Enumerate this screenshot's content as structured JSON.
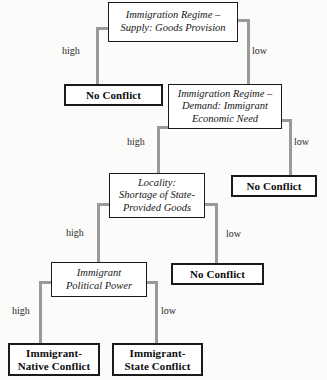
{
  "diagram": {
    "type": "decision-tree",
    "colors": {
      "background": "#fbfbfa",
      "node_border": "#1a1a1a",
      "node_fill": "#ffffff",
      "connector": "#9a9a9a",
      "text": "#161616"
    },
    "nodes": [
      {
        "id": "immigration-regime-supply",
        "kind": "decision",
        "lines": [
          "Immigration Regime –",
          "Supply: Goods Provision"
        ]
      },
      {
        "id": "no-conflict-1",
        "kind": "terminal",
        "lines": [
          "No Conflict"
        ]
      },
      {
        "id": "immigration-regime-demand",
        "kind": "decision",
        "lines": [
          "Immigration Regime –",
          "Demand: Immigrant",
          "Economic Need"
        ]
      },
      {
        "id": "no-conflict-2",
        "kind": "terminal",
        "lines": [
          "No Conflict"
        ]
      },
      {
        "id": "locality-shortage",
        "kind": "decision",
        "lines": [
          "Locality:",
          "Shortage of State-",
          "Provided Goods"
        ]
      },
      {
        "id": "no-conflict-3",
        "kind": "terminal",
        "lines": [
          "No Conflict"
        ]
      },
      {
        "id": "immigrant-political-power",
        "kind": "decision",
        "lines": [
          "Immigrant",
          "Political Power"
        ]
      },
      {
        "id": "immigrant-native-conflict",
        "kind": "terminal",
        "lines": [
          "Immigrant-",
          "Native Conflict"
        ]
      },
      {
        "id": "immigrant-state-conflict",
        "kind": "terminal",
        "lines": [
          "Immigrant-",
          "State Conflict"
        ]
      }
    ],
    "edges": [
      {
        "id": "supply-high",
        "from": "immigration-regime-supply",
        "to": "no-conflict-1",
        "label": "high"
      },
      {
        "id": "supply-low",
        "from": "immigration-regime-supply",
        "to": "immigration-regime-demand",
        "label": "low"
      },
      {
        "id": "demand-high",
        "from": "immigration-regime-demand",
        "to": "locality-shortage",
        "label": "high"
      },
      {
        "id": "demand-low",
        "from": "immigration-regime-demand",
        "to": "no-conflict-2",
        "label": "low"
      },
      {
        "id": "locality-high",
        "from": "locality-shortage",
        "to": "immigrant-political-power",
        "label": "high"
      },
      {
        "id": "locality-low",
        "from": "locality-shortage",
        "to": "no-conflict-3",
        "label": "low"
      },
      {
        "id": "power-high",
        "from": "immigrant-political-power",
        "to": "immigrant-native-conflict",
        "label": "high"
      },
      {
        "id": "power-low",
        "from": "immigrant-political-power",
        "to": "immigrant-state-conflict",
        "label": "low"
      }
    ]
  }
}
